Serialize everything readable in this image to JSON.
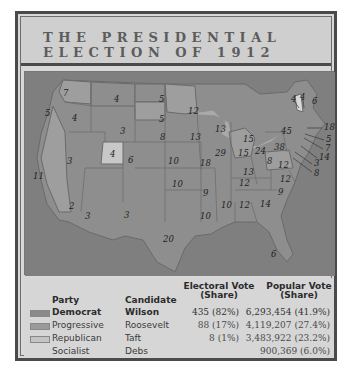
{
  "title": {
    "line1": "THE PRESIDENTIAL",
    "line2": "ELECTION OF 1912"
  },
  "colors": {
    "democrat": "#8e8e8e",
    "progressive": "#9e9e9e",
    "republican": "#c8c8c8",
    "water": "#7c7c7c",
    "frame": "#4a4a4a",
    "background": "#d6d6d6"
  },
  "map": {
    "state_labels": [
      {
        "state": "WA",
        "ev": "7"
      },
      {
        "state": "OR",
        "ev": "5"
      },
      {
        "state": "CA",
        "ev": "11"
      },
      {
        "state": "CA-2",
        "ev": "2"
      },
      {
        "state": "ID",
        "ev": "4"
      },
      {
        "state": "NV",
        "ev": "3"
      },
      {
        "state": "UT",
        "ev": "4"
      },
      {
        "state": "AZ",
        "ev": "3"
      },
      {
        "state": "MT",
        "ev": "4"
      },
      {
        "state": "WY",
        "ev": "3"
      },
      {
        "state": "CO",
        "ev": "6"
      },
      {
        "state": "NM",
        "ev": "3"
      },
      {
        "state": "ND",
        "ev": "5"
      },
      {
        "state": "SD",
        "ev": "5"
      },
      {
        "state": "NE",
        "ev": "8"
      },
      {
        "state": "KS",
        "ev": "10"
      },
      {
        "state": "OK",
        "ev": "10"
      },
      {
        "state": "TX",
        "ev": "20"
      },
      {
        "state": "MN",
        "ev": "12"
      },
      {
        "state": "IA",
        "ev": "13"
      },
      {
        "state": "MO",
        "ev": "18"
      },
      {
        "state": "AR",
        "ev": "9"
      },
      {
        "state": "LA",
        "ev": "10"
      },
      {
        "state": "WI",
        "ev": "13"
      },
      {
        "state": "IL",
        "ev": "29"
      },
      {
        "state": "MI",
        "ev": "15"
      },
      {
        "state": "IN",
        "ev": "15"
      },
      {
        "state": "OH",
        "ev": "24"
      },
      {
        "state": "KY",
        "ev": "13"
      },
      {
        "state": "TN",
        "ev": "12"
      },
      {
        "state": "MS",
        "ev": "10"
      },
      {
        "state": "AL",
        "ev": "12"
      },
      {
        "state": "GA",
        "ev": "14"
      },
      {
        "state": "FL",
        "ev": "6"
      },
      {
        "state": "SC",
        "ev": "9"
      },
      {
        "state": "NC",
        "ev": "12"
      },
      {
        "state": "VA",
        "ev": "12"
      },
      {
        "state": "WV",
        "ev": "8"
      },
      {
        "state": "PA",
        "ev": "38"
      },
      {
        "state": "NY",
        "ev": "45"
      },
      {
        "state": "VT",
        "ev": "4"
      },
      {
        "state": "NH",
        "ev": "4"
      },
      {
        "state": "ME",
        "ev": "6"
      },
      {
        "state": "MA",
        "ev": "18"
      },
      {
        "state": "RI",
        "ev": "5"
      },
      {
        "state": "CT",
        "ev": "7"
      },
      {
        "state": "NJ",
        "ev": "14"
      },
      {
        "state": "DE",
        "ev": "3"
      },
      {
        "state": "MD",
        "ev": "8"
      }
    ]
  },
  "legend": {
    "headers": {
      "party": "Party",
      "candidate": "Candidate",
      "electoral_line1": "Electoral Vote",
      "electoral_line2": "(Share)",
      "popular_line1": "Popular Vote",
      "popular_line2": "(Share)"
    },
    "rows": [
      {
        "party": "Democrat",
        "candidate": "Wilson",
        "electoral": "435 (82%)",
        "popular": "6,293,454 (41.9%)"
      },
      {
        "party": "Progressive",
        "candidate": "Roosevelt",
        "electoral": "88 (17%)",
        "popular": "4,119,207 (27.4%)"
      },
      {
        "party": "Republican",
        "candidate": "Taft",
        "electoral": "8 (1%)",
        "popular": "3,483,922 (23.2%)"
      },
      {
        "party": "Socialist",
        "candidate": "Debs",
        "electoral": "",
        "popular": "900,369 (6.0%)"
      }
    ]
  }
}
